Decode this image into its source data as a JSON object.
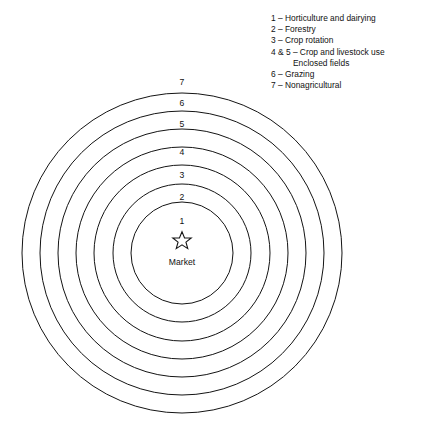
{
  "legend": {
    "name": "thunen-model-legend",
    "entries": [
      {
        "text": "1 – Horticulture and dairying",
        "indented": false
      },
      {
        "text": "2 – Forestry",
        "indented": false
      },
      {
        "text": "3 – Crop rotation",
        "indented": false
      },
      {
        "text": "4 & 5 – Crop and livestock use",
        "indented": false
      },
      {
        "text": "Enclosed fields",
        "indented": true
      },
      {
        "text": "6 – Grazing",
        "indented": false
      },
      {
        "text": "7 – Nonagricultural",
        "indented": false
      }
    ]
  },
  "diagram": {
    "type": "concentric-rings",
    "center_label": "Market",
    "center_icon": "star-icon",
    "center_x": 182,
    "center_y": 253,
    "star_x": 182,
    "star_y": 240,
    "stroke_color": "#141414",
    "background_color": "#ffffff",
    "rings": [
      {
        "number": "1",
        "radius": 51,
        "label_y": 215
      },
      {
        "number": "2",
        "radius": 69,
        "label_y": 197
      },
      {
        "number": "3",
        "radius": 88,
        "label_y": 178
      },
      {
        "number": "4",
        "radius": 106,
        "label_y": 159
      },
      {
        "number": "5",
        "radius": 124,
        "label_y": 140
      },
      {
        "number": "6",
        "radius": 142,
        "label_y": 120
      },
      {
        "number": "7",
        "radius": 160,
        "label_y": 100
      }
    ],
    "ring_label_x": 182
  }
}
